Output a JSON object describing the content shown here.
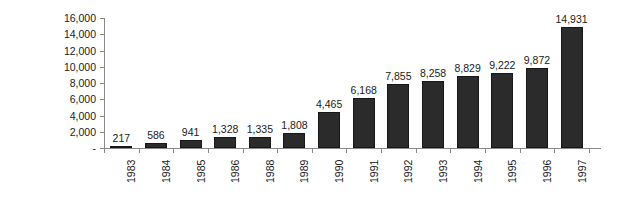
{
  "chart_data": {
    "type": "bar",
    "title": "",
    "subtitle": "",
    "xlabel": "",
    "ylabel": "millions DM",
    "categories": [
      "1983",
      "1984",
      "1985",
      "1986",
      "1988",
      "1989",
      "1990",
      "1991",
      "1992",
      "1993",
      "1994",
      "1995",
      "1996",
      "1997"
    ],
    "values": [
      217,
      586,
      941,
      1328,
      1335,
      1808,
      4465,
      6168,
      7855,
      8258,
      8829,
      9222,
      9872,
      14931
    ],
    "value_labels": [
      "217",
      "586",
      "941",
      "1,328",
      "1,335",
      "1,808",
      "4,465",
      "6,168",
      "7,855",
      "8,258",
      "8,829",
      "9,222",
      "9,872",
      "14,931"
    ],
    "ylim": [
      0,
      16000
    ],
    "ytick_values": [
      16000,
      14000,
      12000,
      10000,
      8000,
      6000,
      4000,
      2000,
      0
    ],
    "ytick_labels": [
      "16,000",
      "14,000",
      "12,000",
      "10,000",
      "8,000",
      "6,000",
      "4,000",
      "2,000",
      "-"
    ],
    "grid": false,
    "legend": null,
    "legend_position": "none",
    "bar_color": "#2b2b2b",
    "axis_color": "#8a8a8a",
    "text_color": "#1a1a1a",
    "background_color": "#ffffff",
    "data_labels_shown": true,
    "x_labels_rotation": -90
  }
}
